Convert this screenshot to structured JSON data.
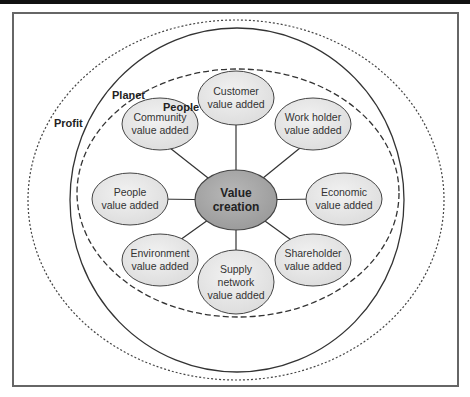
{
  "diagram": {
    "rings": {
      "profit": {
        "label": "Profit",
        "style": "dotted"
      },
      "planet": {
        "label": "Planet",
        "style": "solid"
      },
      "people": {
        "label": "People",
        "style": "dashed"
      }
    },
    "center": {
      "label": "Value\ncreation",
      "fill": "#a9a9a9"
    },
    "nodes": [
      {
        "id": "customer",
        "label": "Customer\nvalue added"
      },
      {
        "id": "work-holder",
        "label": "Work holder\nvalue added"
      },
      {
        "id": "economic",
        "label": "Economic\nvalue added"
      },
      {
        "id": "shareholder",
        "label": "Shareholder\nvalue added"
      },
      {
        "id": "supply-network",
        "label": "Supply\nnetwork\nvalue added"
      },
      {
        "id": "environment",
        "label": "Environment\nvalue added"
      },
      {
        "id": "people",
        "label": "People\nvalue added"
      },
      {
        "id": "community",
        "label": "Community\nvalue added"
      }
    ],
    "colors": {
      "node_fill": "#e6e6e6",
      "center_fill": "#a9a9a9",
      "stroke": "#333333"
    }
  }
}
